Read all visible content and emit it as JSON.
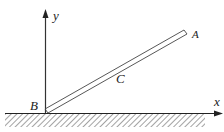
{
  "diagram": {
    "labels": {
      "y_axis": "y",
      "x_axis": "x",
      "point_a": "A",
      "point_b": "B",
      "point_c": "C"
    },
    "colors": {
      "stroke": "#333333",
      "hatch": "#555555",
      "background": "#ffffff"
    }
  }
}
